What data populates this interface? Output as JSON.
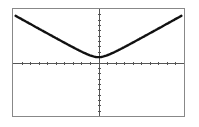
{
  "chart_data": {
    "type": "line",
    "title": "",
    "xlabel": "",
    "ylabel": "",
    "xlim": [
      -10,
      10
    ],
    "ylim": [
      -10,
      10
    ],
    "xscale_ticks": 1,
    "yscale_ticks": 1,
    "grid": false,
    "legend": null,
    "series": [
      {
        "name": "curve",
        "description": "V-shaped curve with rounded vertex, approx y = sqrt(0.8x^2 + 1)",
        "x": [
          -10,
          -8,
          -6,
          -4,
          -2,
          -1,
          0,
          1,
          2,
          4,
          6,
          8,
          10
        ],
        "y": [
          9.0,
          7.2,
          5.5,
          3.7,
          2.0,
          1.3,
          1.0,
          1.3,
          2.0,
          3.7,
          5.5,
          7.2,
          9.0
        ]
      }
    ]
  },
  "colors": {
    "frame": "#888888",
    "axes": "#555555",
    "curve": "#111111",
    "background": "#ffffff"
  }
}
